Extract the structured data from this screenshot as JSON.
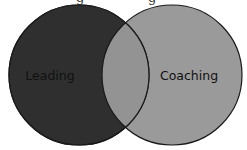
{
  "diagram": {
    "type": "venn",
    "sets": [
      {
        "id": "leading",
        "label": "Leading",
        "fill": "#2f2f2f"
      },
      {
        "id": "coaching",
        "label": "Coaching",
        "fill": "#9a9a9a"
      }
    ],
    "overlap": {
      "sets": [
        "leading",
        "coaching"
      ],
      "label": "",
      "fill": "#939393"
    },
    "outline_color": "#1a1a1a",
    "label_color": "#111111"
  }
}
